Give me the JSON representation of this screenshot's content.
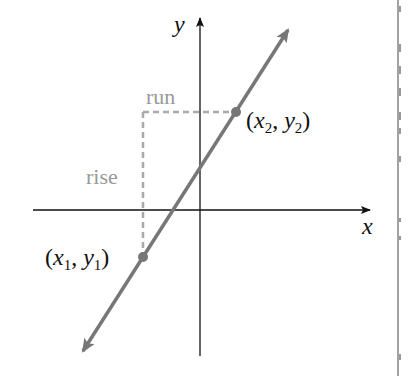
{
  "diagram": {
    "axes": {
      "x_label": "x",
      "y_label": "y"
    },
    "labels": {
      "run": "run",
      "rise": "rise",
      "point1": {
        "x": "x",
        "xsub": "1",
        "y": "y",
        "ysub": "1"
      },
      "point2": {
        "x": "x",
        "xsub": "2",
        "y": "y",
        "ysub": "2"
      }
    },
    "colors": {
      "axis": "#111111",
      "line": "#777777",
      "dashed": "#a9a9a9",
      "label_gray": "#999999",
      "text": "#111111"
    }
  }
}
